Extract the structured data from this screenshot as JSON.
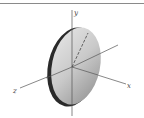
{
  "figure": {
    "type": "3d-axes-disk",
    "axes": {
      "x_label": "x",
      "y_label": "y",
      "z_label": "z"
    },
    "colors": {
      "axis": "#555555",
      "disk_face_light": "#e6e6e6",
      "disk_face_dark": "#9a9a9a",
      "disk_rim": "#2a2a2a",
      "top_rule": "#888888"
    },
    "elements": [
      "top-rule",
      "y-axis",
      "x-axis",
      "z-axis",
      "disk",
      "radius-line"
    ]
  }
}
